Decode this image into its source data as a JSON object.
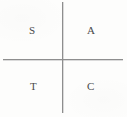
{
  "diagram": {
    "background_color": "#fdfdfc",
    "axis_color": "#8e8e8e",
    "label_color": "#4a4a4a",
    "axes": {
      "horizontal_label": "x-axis",
      "vertical_label": "y-axis",
      "origin_x": 62,
      "origin_y": 59
    },
    "quadrants": [
      {
        "id": "q1",
        "position": "upper-right",
        "label": "A"
      },
      {
        "id": "q2",
        "position": "upper-left",
        "label": "S"
      },
      {
        "id": "q3",
        "position": "lower-left",
        "label": "T"
      },
      {
        "id": "q4",
        "position": "lower-right",
        "label": "C"
      }
    ]
  }
}
